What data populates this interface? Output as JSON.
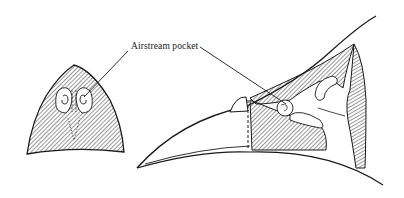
{
  "figure": {
    "labels": {
      "airstream_pocket": "Airstream pocket"
    },
    "panels": [
      {
        "name": "cross-section",
        "description": "transverse section of bill showing paired nasal conchae"
      },
      {
        "name": "sagittal-section",
        "description": "longitudinal section of bill and nasal cavity"
      }
    ],
    "colors": {
      "ink": "#1a1a1a",
      "background": "#ffffff"
    }
  }
}
